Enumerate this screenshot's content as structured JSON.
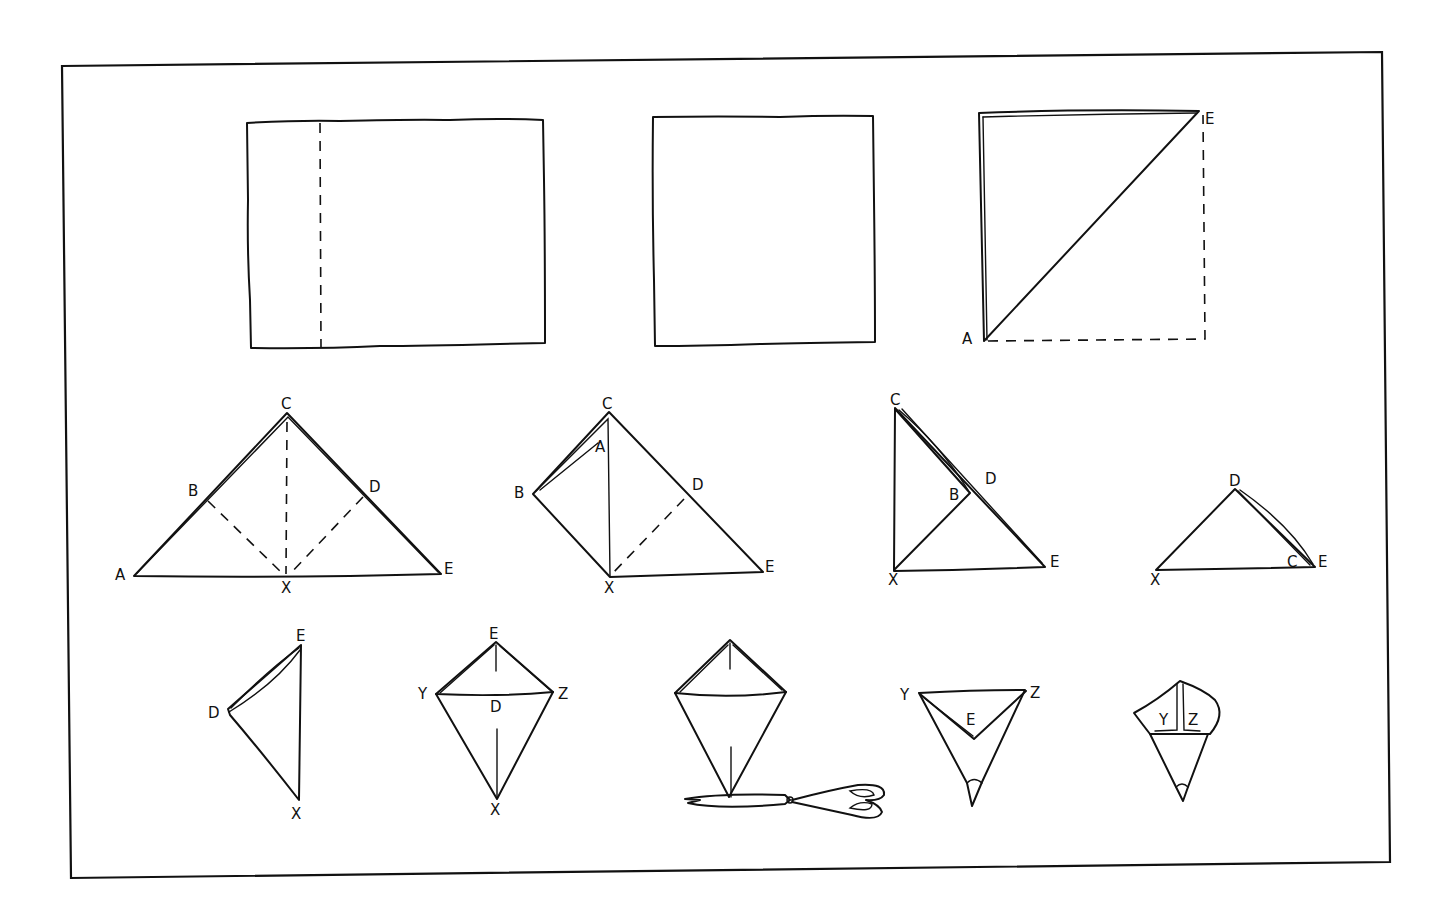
{
  "diagram": {
    "title": "",
    "steps": [
      {
        "id": 1,
        "shape": "rectangle-with-dashed-fold-line",
        "labels": []
      },
      {
        "id": 2,
        "shape": "square",
        "labels": []
      },
      {
        "id": 3,
        "shape": "square-folded-diagonally",
        "labels": [
          "E",
          "A"
        ]
      },
      {
        "id": 4,
        "shape": "triangle-with-dashed-folds",
        "labels": [
          "C",
          "B",
          "D",
          "A",
          "X",
          "E"
        ]
      },
      {
        "id": 5,
        "shape": "triangle-left-corner-folded",
        "labels": [
          "C",
          "A",
          "B",
          "D",
          "X",
          "E"
        ]
      },
      {
        "id": 6,
        "shape": "triangle-right-angle",
        "labels": [
          "C",
          "D",
          "B",
          "X",
          "E"
        ]
      },
      {
        "id": 7,
        "shape": "small-triangle",
        "labels": [
          "D",
          "C",
          "E",
          "X"
        ]
      },
      {
        "id": 8,
        "shape": "cone-side",
        "labels": [
          "E",
          "D",
          "X"
        ]
      },
      {
        "id": 9,
        "shape": "kite",
        "labels": [
          "E",
          "Y",
          "D",
          "Z",
          "X"
        ]
      },
      {
        "id": 10,
        "shape": "kite-with-scissors",
        "labels": []
      },
      {
        "id": 11,
        "shape": "cup-open",
        "labels": [
          "Y",
          "Z",
          "E"
        ]
      },
      {
        "id": 12,
        "shape": "cup-finished",
        "labels": [
          "Y",
          "Z"
        ]
      }
    ],
    "labels": {
      "s3": {
        "E": "E",
        "A": "A"
      },
      "s4": {
        "C": "C",
        "B": "B",
        "D": "D",
        "A": "A",
        "X": "X",
        "E": "E"
      },
      "s5": {
        "C": "C",
        "A": "A",
        "B": "B",
        "D": "D",
        "X": "X",
        "E": "E"
      },
      "s6": {
        "C": "C",
        "D": "D",
        "B": "B",
        "X": "X",
        "E": "E"
      },
      "s7": {
        "D": "D",
        "C": "C",
        "E": "E",
        "X": "X"
      },
      "s8": {
        "E": "E",
        "D": "D",
        "X": "X"
      },
      "s9": {
        "E": "E",
        "Y": "Y",
        "D": "D",
        "Z": "Z",
        "X": "X"
      },
      "s11": {
        "Y": "Y",
        "Z": "Z",
        "E": "E"
      },
      "s12": {
        "Y": "Y",
        "Z": "Z"
      }
    },
    "colors": {
      "ink": "#111111",
      "paper": "#ffffff"
    }
  }
}
